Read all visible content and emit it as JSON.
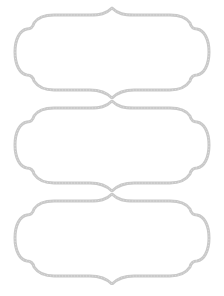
{
  "page": {
    "background": "#ffffff",
    "frame_stroke_color": "#c9c9c9",
    "frame_fill_color": "#ffffff"
  },
  "labels": [
    {
      "text": ""
    },
    {
      "text": ""
    },
    {
      "text": ""
    }
  ]
}
